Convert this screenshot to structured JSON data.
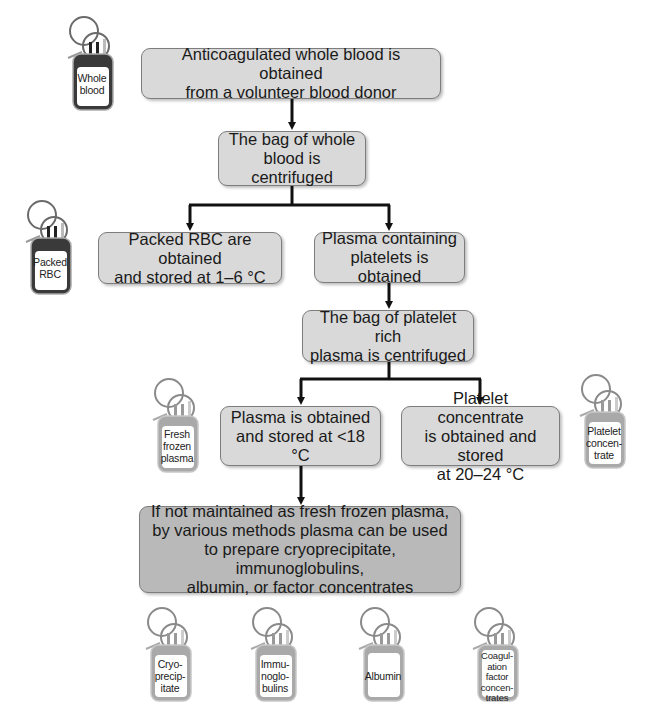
{
  "diagram": {
    "steps": [
      {
        "id": "donation",
        "text": "Anticoagulated whole blood is obtained\nfrom a volunteer blood donor"
      },
      {
        "id": "centrifuge-whole",
        "text": "The bag of whole\nblood is centrifuged"
      },
      {
        "id": "packed-rbc",
        "text": "Packed RBC are obtained\nand stored at 1–6 °C"
      },
      {
        "id": "prp",
        "text": "Plasma containing\nplatelets is obtained"
      },
      {
        "id": "centrifuge-prp",
        "text": "The bag of platelet rich\nplasma is centrifuged"
      },
      {
        "id": "plasma",
        "text": "Plasma is obtained\nand stored at <18 °C"
      },
      {
        "id": "platelet-concentrate",
        "text": "Platelet concentrate\nis obtained and stored\nat 20–24 °C"
      },
      {
        "id": "fractionation",
        "text": "If not maintained as fresh frozen plasma,\nby various methods plasma can be used\nto prepare cryoprecipitate, immunoglobulins,\nalbumin, or factor concentrates"
      }
    ],
    "bags": [
      {
        "id": "whole-blood",
        "label": "Whole\nblood",
        "tone": "dark"
      },
      {
        "id": "packed-rbc",
        "label": "Packed\nRBC",
        "tone": "dark"
      },
      {
        "id": "fresh-frozen-plasma",
        "label": "Fresh\nfrozen\nplasma",
        "tone": "light"
      },
      {
        "id": "platelet-concentrate",
        "label": "Platelet\nconcen-\ntrate",
        "tone": "light"
      },
      {
        "id": "cryoprecipitate",
        "label": "Cryo-\nprecip-\nitate",
        "tone": "light"
      },
      {
        "id": "immunoglobulins",
        "label": "Immu-\nnoglo-\nbulins",
        "tone": "light"
      },
      {
        "id": "albumin",
        "label": "Albumin",
        "tone": "light"
      },
      {
        "id": "coagulation-factor-concentrates",
        "label": "Coagul-\nation\nfactor\nconcen-\ntrates",
        "tone": "light"
      }
    ],
    "colors": {
      "box_fill": "#d9d9d9",
      "box_fill_dark": "#b9b9b9",
      "box_border": "#7d7d7d",
      "arrow": "#111111",
      "bag_dark": "#3a3a3a",
      "bag_light": "#a9a9a9"
    }
  }
}
